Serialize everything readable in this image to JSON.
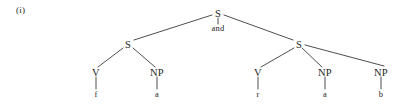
{
  "figure": {
    "example_label": "(i)",
    "caption": "",
    "line_color": "#3a3a3a",
    "text_color": "#242424",
    "background": "#ffffff",
    "width": 404,
    "height": 105
  },
  "tree": {
    "nodes": [
      {
        "id": "root",
        "label": "S",
        "kind": "cat",
        "x": 218,
        "y": 13
      },
      {
        "id": "conj",
        "label": "and",
        "kind": "conj",
        "x": 218,
        "y": 28
      },
      {
        "id": "s_left",
        "label": "S",
        "kind": "cat",
        "x": 128,
        "y": 44
      },
      {
        "id": "s_right",
        "label": "S",
        "kind": "cat",
        "x": 299,
        "y": 44
      },
      {
        "id": "v_left",
        "label": "V",
        "kind": "cat",
        "x": 96,
        "y": 72
      },
      {
        "id": "np_left",
        "label": "NP",
        "kind": "cat",
        "x": 157,
        "y": 72
      },
      {
        "id": "v_right",
        "label": "V",
        "kind": "cat",
        "x": 258,
        "y": 72
      },
      {
        "id": "np_mid",
        "label": "NP",
        "kind": "cat",
        "x": 325,
        "y": 72
      },
      {
        "id": "np_right",
        "label": "NP",
        "kind": "cat",
        "x": 381,
        "y": 72
      },
      {
        "id": "leaf_f",
        "label": "f",
        "kind": "leaf",
        "x": 96,
        "y": 94
      },
      {
        "id": "leaf_a1",
        "label": "a",
        "kind": "leaf",
        "x": 157,
        "y": 94
      },
      {
        "id": "leaf_r",
        "label": "r",
        "kind": "leaf",
        "x": 258,
        "y": 94
      },
      {
        "id": "leaf_a2",
        "label": "a",
        "kind": "leaf",
        "x": 325,
        "y": 94
      },
      {
        "id": "leaf_b",
        "label": "b",
        "kind": "leaf",
        "x": 381,
        "y": 94
      }
    ],
    "edges": [
      {
        "from": "root",
        "to": "s_left",
        "x1": 212,
        "y1": 15,
        "x2": 134,
        "y2": 40
      },
      {
        "from": "root",
        "to": "s_right",
        "x1": 224,
        "y1": 15,
        "x2": 293,
        "y2": 40
      },
      {
        "from": "root",
        "to": "conj",
        "x1": 218,
        "y1": 18,
        "x2": 218,
        "y2": 24
      },
      {
        "from": "s_left",
        "to": "v_left",
        "x1": 123,
        "y1": 48,
        "x2": 98,
        "y2": 67
      },
      {
        "from": "s_left",
        "to": "np_left",
        "x1": 133,
        "y1": 48,
        "x2": 155,
        "y2": 67
      },
      {
        "from": "s_right",
        "to": "v_right",
        "x1": 294,
        "y1": 48,
        "x2": 261,
        "y2": 67
      },
      {
        "from": "s_right",
        "to": "np_mid",
        "x1": 302,
        "y1": 48,
        "x2": 322,
        "y2": 67
      },
      {
        "from": "s_right",
        "to": "np_right",
        "x1": 305,
        "y1": 45,
        "x2": 384,
        "y2": 66
      },
      {
        "from": "v_left",
        "to": "leaf_f",
        "x1": 96,
        "y1": 77,
        "x2": 96,
        "y2": 89
      },
      {
        "from": "np_left",
        "to": "leaf_a1",
        "x1": 157,
        "y1": 77,
        "x2": 157,
        "y2": 89
      },
      {
        "from": "v_right",
        "to": "leaf_r",
        "x1": 258,
        "y1": 77,
        "x2": 258,
        "y2": 89
      },
      {
        "from": "np_mid",
        "to": "leaf_a2",
        "x1": 325,
        "y1": 77,
        "x2": 325,
        "y2": 89
      },
      {
        "from": "np_right",
        "to": "leaf_b",
        "x1": 381,
        "y1": 77,
        "x2": 381,
        "y2": 89
      }
    ]
  }
}
